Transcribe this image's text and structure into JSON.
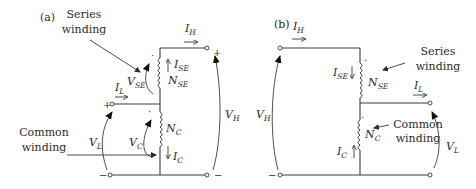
{
  "figure": {
    "panel_a": {
      "label": "(a)",
      "series_winding_label_line1": "Series",
      "series_winding_label_line2": "winding",
      "common_winding_label_line1": "Common",
      "common_winding_label_line2": "winding",
      "I_H": {
        "main": "I",
        "sub": "H"
      },
      "I_SE": {
        "main": "I",
        "sub": "SE"
      },
      "N_SE": {
        "main": "N",
        "sub": "SE"
      },
      "V_SE": {
        "main": "V",
        "sub": "SE"
      },
      "I_L": {
        "main": "I",
        "sub": "L"
      },
      "V_L": {
        "main": "V",
        "sub": "L"
      },
      "V_C": {
        "main": "V",
        "sub": "C"
      },
      "N_C": {
        "main": "N",
        "sub": "C"
      },
      "I_C": {
        "main": "I",
        "sub": "C"
      },
      "V_H": {
        "main": "V",
        "sub": "H"
      },
      "plus_low": "+",
      "plus_high": "+",
      "minus_left": "−",
      "minus_right": "−",
      "dot": "·"
    },
    "panel_b": {
      "label": "(b)",
      "series_winding_label_line1": "Series",
      "series_winding_label_line2": "winding",
      "common_winding_label_line1": "Common",
      "common_winding_label_line2": "winding",
      "I_H": {
        "main": "I",
        "sub": "H"
      },
      "I_SE": {
        "main": "I",
        "sub": "SE"
      },
      "N_SE": {
        "main": "N",
        "sub": "SE"
      },
      "I_L": {
        "main": "I",
        "sub": "L"
      },
      "V_H": {
        "main": "V",
        "sub": "H"
      },
      "N_C": {
        "main": "N",
        "sub": "C"
      },
      "I_C": {
        "main": "I",
        "sub": "C"
      },
      "V_L": {
        "main": "V",
        "sub": "L"
      },
      "minus_left": "−",
      "dot": "·"
    }
  }
}
